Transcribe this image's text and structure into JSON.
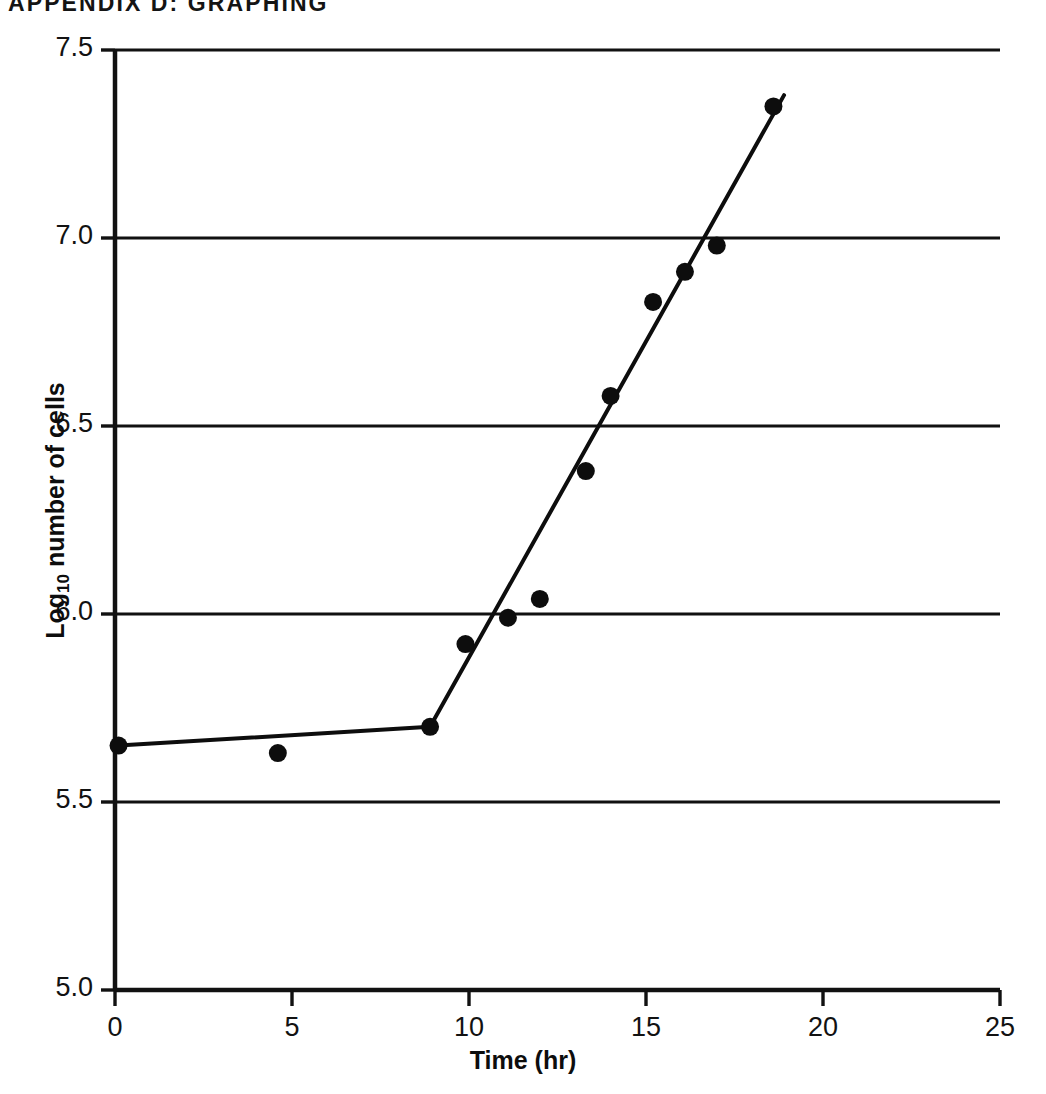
{
  "page": {
    "running_head": "APPENDIX D: GRAPHING",
    "background_color": "#ffffff",
    "ink_color": "#111111"
  },
  "chart_data": {
    "type": "scatter",
    "title": "",
    "subtitle": "",
    "xlabel": "Time (hr)",
    "ylabel": "Log10 number of cells",
    "ylabel_base": "Log",
    "ylabel_sub": "10",
    "ylabel_rest": " number of cells",
    "xlim": [
      0,
      25
    ],
    "ylim": [
      5.0,
      7.5
    ],
    "xticks": [
      0,
      5,
      10,
      15,
      20,
      25
    ],
    "xtick_labels": [
      "0",
      "5",
      "10",
      "15",
      "20",
      "25"
    ],
    "yticks": [
      5.0,
      5.5,
      6.0,
      6.5,
      7.0,
      7.5
    ],
    "ytick_labels": [
      "5.0",
      "5.5",
      "6.0",
      "6.5",
      "7.0",
      "7.5"
    ],
    "grid": "horizontal",
    "grid_color": "#111111",
    "legend": "none",
    "marker": "filled-circle",
    "marker_color": "#0d0d0d",
    "marker_size_px": 9,
    "line_color": "#0d0d0d",
    "line_width_px": 4,
    "x": [
      0.1,
      4.6,
      8.9,
      9.9,
      11.1,
      12.0,
      13.3,
      14.0,
      15.2,
      16.1,
      17.0,
      18.6
    ],
    "y": [
      5.65,
      5.63,
      5.7,
      5.92,
      5.99,
      6.04,
      6.38,
      6.58,
      6.83,
      6.91,
      6.98,
      7.35
    ],
    "points": [
      {
        "x": 0.1,
        "y": 5.65
      },
      {
        "x": 4.6,
        "y": 5.63
      },
      {
        "x": 8.9,
        "y": 5.7
      },
      {
        "x": 9.9,
        "y": 5.92
      },
      {
        "x": 11.1,
        "y": 5.99
      },
      {
        "x": 12.0,
        "y": 6.04
      },
      {
        "x": 13.3,
        "y": 6.38
      },
      {
        "x": 14.0,
        "y": 6.58
      },
      {
        "x": 15.2,
        "y": 6.83
      },
      {
        "x": 16.1,
        "y": 6.91
      },
      {
        "x": 17.0,
        "y": 6.98
      },
      {
        "x": 18.6,
        "y": 7.35
      }
    ],
    "series": [
      {
        "name": "lag-phase fit",
        "type": "line",
        "points": [
          {
            "x": 0.1,
            "y": 5.65
          },
          {
            "x": 8.9,
            "y": 5.7
          }
        ]
      },
      {
        "name": "log-phase fit",
        "type": "line",
        "points": [
          {
            "x": 8.9,
            "y": 5.7
          },
          {
            "x": 18.9,
            "y": 7.38
          }
        ]
      }
    ],
    "annotations": []
  }
}
